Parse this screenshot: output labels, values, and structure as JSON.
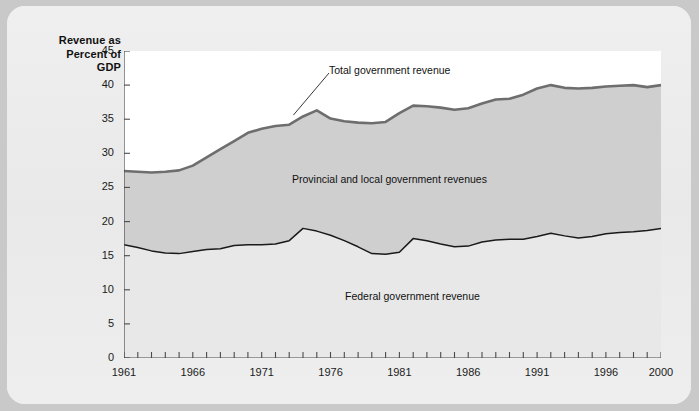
{
  "axis_title": [
    "Revenue as",
    "Percent of",
    "GDP"
  ],
  "colors": {
    "page_background": "#c9c9c9",
    "card_background": "#ededed",
    "plot_background": "#ffffff",
    "provincial_band": "#cfcfcf",
    "federal_band": "#e8e8e8",
    "total_line": "#6e6e6e",
    "federal_line": "#1a1a1a",
    "axis": "#4a4a4a",
    "text": "#111111"
  },
  "annotations": {
    "total": "Total government revenue",
    "provincial": "Provincial and local government revenues",
    "federal": "Federal government revenue"
  },
  "chart_data": {
    "type": "area",
    "title": "",
    "subtitle": "",
    "xlabel": "",
    "ylabel": "Revenue as Percent of GDP",
    "xlim": [
      1961,
      2000
    ],
    "ylim": [
      0,
      45
    ],
    "yticks": [
      0,
      5,
      10,
      15,
      20,
      25,
      30,
      35,
      40,
      45
    ],
    "xticks": [
      1961,
      1962,
      1963,
      1964,
      1965,
      1966,
      1967,
      1968,
      1969,
      1970,
      1971,
      1972,
      1973,
      1974,
      1975,
      1976,
      1977,
      1978,
      1979,
      1980,
      1981,
      1982,
      1983,
      1984,
      1985,
      1986,
      1987,
      1988,
      1989,
      1990,
      1991,
      1992,
      1993,
      1994,
      1995,
      1996,
      1997,
      1998,
      1999,
      2000
    ],
    "xtick_labels": [
      "1961",
      "",
      "",
      "",
      "",
      "1966",
      "",
      "",
      "",
      "",
      "1971",
      "",
      "",
      "",
      "",
      "1976",
      "",
      "",
      "",
      "",
      "1981",
      "",
      "",
      "",
      "",
      "1986",
      "",
      "",
      "",
      "",
      "1991",
      "",
      "",
      "",
      "",
      "1996",
      "",
      "",
      "",
      "2000"
    ],
    "grid": false,
    "legend": "inline annotations",
    "x": [
      1961,
      1962,
      1963,
      1964,
      1965,
      1966,
      1967,
      1968,
      1969,
      1970,
      1971,
      1972,
      1973,
      1974,
      1975,
      1976,
      1977,
      1978,
      1979,
      1980,
      1981,
      1982,
      1983,
      1984,
      1985,
      1986,
      1987,
      1988,
      1989,
      1990,
      1991,
      1992,
      1993,
      1994,
      1995,
      1996,
      1997,
      1998,
      1999,
      2000
    ],
    "series": [
      {
        "name": "Total government revenue",
        "values": [
          27.4,
          27.3,
          27.2,
          27.3,
          27.5,
          28.2,
          29.4,
          30.6,
          31.8,
          33.0,
          33.6,
          34.0,
          34.2,
          35.4,
          36.3,
          35.1,
          34.7,
          34.5,
          34.4,
          34.6,
          35.9,
          37.0,
          36.9,
          36.7,
          36.4,
          36.6,
          37.3,
          37.9,
          38.0,
          38.6,
          39.5,
          40.0,
          39.6,
          39.5,
          39.6,
          39.8,
          39.9,
          40.0,
          39.7,
          40.0
        ]
      },
      {
        "name": "Federal government revenue",
        "values": [
          16.6,
          16.2,
          15.7,
          15.4,
          15.3,
          15.6,
          15.9,
          16.0,
          16.5,
          16.6,
          16.6,
          16.7,
          17.2,
          19.0,
          18.6,
          18.0,
          17.2,
          16.3,
          15.3,
          15.2,
          15.5,
          17.5,
          17.2,
          16.7,
          16.3,
          16.4,
          17.0,
          17.3,
          17.4,
          17.4,
          17.8,
          18.3,
          17.9,
          17.6,
          17.8,
          18.2,
          18.4,
          18.5,
          18.7,
          19.0
        ]
      }
    ]
  }
}
